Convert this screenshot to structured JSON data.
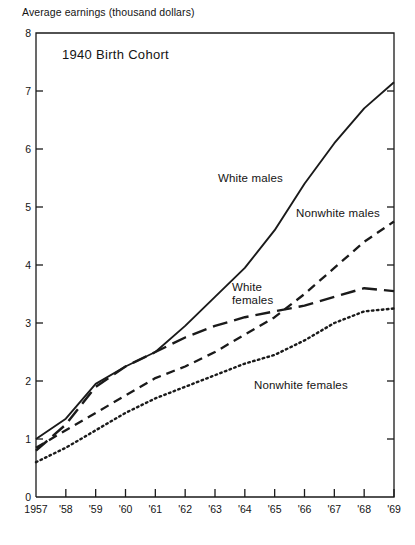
{
  "figure": {
    "axis_caption": "Average earnings (thousand dollars)",
    "plot_title": "1940 Birth Cohort"
  },
  "axes": {
    "y_ticks": [
      "0",
      "1",
      "2",
      "3",
      "4",
      "5",
      "6",
      "7",
      "8"
    ],
    "x_ticks": [
      "1957",
      "'58",
      "'59",
      "'60",
      "'61",
      "'62",
      "'63",
      "'64",
      "'65",
      "'66",
      "'67",
      "'68",
      "'69"
    ]
  },
  "labels": {
    "white_males": "White males",
    "nonwhite_males": "Nonwhite males",
    "white_females_line1": "White",
    "white_females_line2": "females",
    "nonwhite_females": "Nonwhite females"
  },
  "chart_data": {
    "type": "line",
    "title": "1940 Birth Cohort",
    "xlabel": "",
    "ylabel": "Average earnings (thousand dollars)",
    "x": [
      1957,
      1958,
      1959,
      1960,
      1961,
      1962,
      1963,
      1964,
      1965,
      1966,
      1967,
      1968,
      1969
    ],
    "x_tick_labels": [
      "1957",
      "'58",
      "'59",
      "'60",
      "'61",
      "'62",
      "'63",
      "'64",
      "'65",
      "'66",
      "'67",
      "'68",
      "'69"
    ],
    "ylim": [
      0,
      8
    ],
    "y_ticks": [
      0,
      1,
      2,
      3,
      4,
      5,
      6,
      7,
      8
    ],
    "grid": false,
    "legend": "inline-annotations",
    "series": [
      {
        "name": "White males",
        "style": "solid",
        "color": "#1a1a1a",
        "values": [
          1.0,
          1.35,
          1.95,
          2.25,
          2.5,
          2.95,
          3.45,
          3.95,
          4.6,
          5.4,
          6.1,
          6.7,
          7.15
        ]
      },
      {
        "name": "Nonwhite males",
        "style": "dashed",
        "color": "#1a1a1a",
        "values": [
          0.85,
          1.15,
          1.45,
          1.75,
          2.05,
          2.25,
          2.5,
          2.8,
          3.1,
          3.5,
          3.95,
          4.4,
          4.75
        ]
      },
      {
        "name": "White females",
        "style": "long-dashed",
        "color": "#1a1a1a",
        "values": [
          0.8,
          1.25,
          1.9,
          2.25,
          2.5,
          2.75,
          2.95,
          3.1,
          3.2,
          3.3,
          3.45,
          3.6,
          3.55
        ]
      },
      {
        "name": "Nonwhite females",
        "style": "dotted",
        "color": "#1a1a1a",
        "values": [
          0.6,
          0.85,
          1.15,
          1.45,
          1.7,
          1.9,
          2.1,
          2.3,
          2.45,
          2.7,
          3.0,
          3.2,
          3.25
        ]
      }
    ]
  },
  "geometry": {
    "plot_left": 36,
    "plot_right": 394,
    "plot_top": 33,
    "plot_bottom": 497
  }
}
